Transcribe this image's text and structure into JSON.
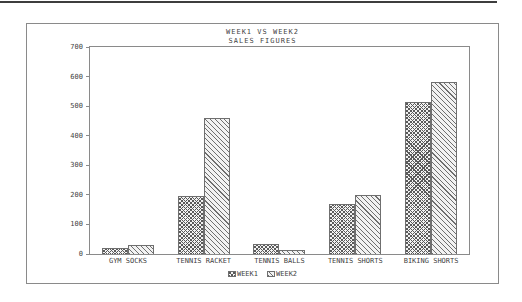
{
  "page": {
    "background": "#ffffff",
    "top_rule_color": "#3d3d3d",
    "frame_border_color": "#8a8a8a",
    "text_color": "#3f3f3f"
  },
  "chart_data": {
    "type": "bar",
    "title": "WEEK1 VS WEEK2",
    "subtitle": "SALES FIGURES",
    "categories": [
      "GYM SOCKS",
      "TENNIS RACKET",
      "TENNIS BALLS",
      "TENNIS SHORTS",
      "BIKING SHORTS"
    ],
    "series": [
      {
        "name": "WEEK1",
        "pattern": "crosshatch",
        "values": [
          20,
          195,
          35,
          170,
          515
        ]
      },
      {
        "name": "WEEK2",
        "pattern": "diagonal",
        "values": [
          30,
          460,
          12,
          200,
          580
        ]
      }
    ],
    "xlabel": "",
    "ylabel": "",
    "ylim": [
      0,
      700
    ],
    "yticks": [
      0,
      100,
      200,
      300,
      400,
      500,
      600,
      700
    ],
    "grid": false,
    "legend_position": "bottom-center"
  }
}
